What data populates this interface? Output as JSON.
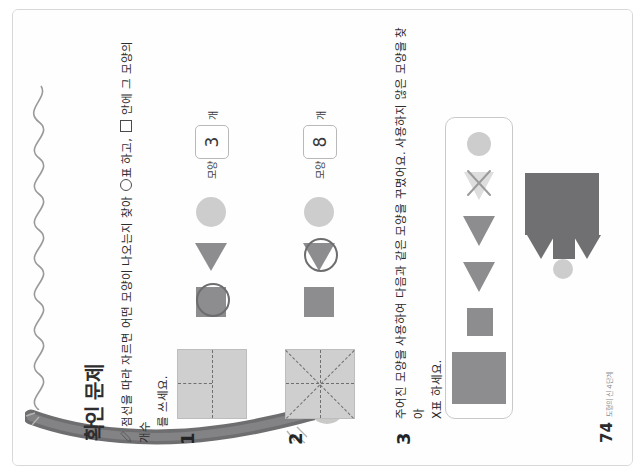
{
  "page": {
    "title": "확인 문제",
    "footer": {
      "number": "74",
      "label": "도형의 신 4단계"
    },
    "colors": {
      "paper": "#fdfdfc",
      "shape_dark": "#8d8d8f",
      "shape_light": "#cdcdcd",
      "fold_square": "#cfcfcf",
      "text": "#2c2c2e",
      "box_border": "#b9b9b9"
    }
  },
  "instruction": {
    "icon": "pencil-icon",
    "line1_a": "점선을 따라 자르면 어떤 모양이 나오는지 찾아 ",
    "circle_glyph": "circle-mark-icon",
    "line1_b": "표 하고, ",
    "box_glyph": "answer-box-icon",
    "line1_c": " 안에 그 모양의 개수",
    "line2": "를 쓰세요."
  },
  "problems": [
    {
      "number": "1",
      "figure": {
        "name": "folded-square-t-cut",
        "fold_pattern": "vertical-half-top plus horizontal-middle"
      },
      "options": [
        {
          "shape": "square",
          "label": "(   ) 모양",
          "selected": true,
          "fill": "#8d8d8f"
        },
        {
          "shape": "triangle",
          "label": "",
          "selected": false,
          "fill": "#8d8d8f"
        },
        {
          "shape": "circle",
          "label": "",
          "selected": false,
          "fill": "#cdcdcd"
        }
      ],
      "option_caption": "모양",
      "answer": "3",
      "unit": "개"
    },
    {
      "number": "2",
      "figure": {
        "name": "folded-square-asterisk-cut",
        "fold_pattern": "two diagonals plus vertical and horizontal"
      },
      "options": [
        {
          "shape": "square",
          "label": "(   ) 모양",
          "selected": false,
          "fill": "#8d8d8f"
        },
        {
          "shape": "triangle",
          "label": "",
          "selected": true,
          "fill": "#8d8d8f"
        },
        {
          "shape": "circle",
          "label": "",
          "selected": false,
          "fill": "#cdcdcd"
        }
      ],
      "option_caption": "모양",
      "answer": "8",
      "unit": "개"
    },
    {
      "number": "3",
      "line1": "주어진 모양을 사용하여 다음과 같은 모양을 꾸몄어요. 사용하지 않은 모양을 찾아",
      "line2": "X표 하세요.",
      "palette": [
        {
          "name": "large-square",
          "shape": "square",
          "w": 52,
          "h": 64,
          "fill": "#8d8d8f",
          "marked": false
        },
        {
          "name": "small-square",
          "shape": "square",
          "w": 28,
          "h": 26,
          "fill": "#8d8d8f",
          "marked": false
        },
        {
          "name": "triangle-1",
          "shape": "triangle",
          "w": 34,
          "h": 32,
          "fill": "#8d8d8f",
          "marked": false
        },
        {
          "name": "triangle-2",
          "shape": "triangle",
          "w": 34,
          "h": 32,
          "fill": "#8d8d8f",
          "marked": false
        },
        {
          "name": "triangle-light",
          "shape": "triangle",
          "w": 32,
          "h": 30,
          "fill": "#dedede",
          "marked": true
        },
        {
          "name": "circle",
          "shape": "circle",
          "w": 24,
          "h": 24,
          "fill": "#cdcdcd",
          "marked": false
        }
      ],
      "x_mark": "x-mark-icon",
      "composition": {
        "name": "house-figure",
        "parts": [
          {
            "name": "body-rectangle",
            "shape": "square",
            "fill": "#707072"
          },
          {
            "name": "roof-triangle-top",
            "shape": "triangle",
            "fill": "#707072"
          },
          {
            "name": "roof-triangle-bottom",
            "shape": "triangle",
            "fill": "#707072"
          },
          {
            "name": "window-square",
            "shape": "square",
            "fill": "#707072"
          },
          {
            "name": "sun-circle",
            "shape": "circle",
            "fill": "#cdcdcd"
          }
        ]
      }
    }
  ]
}
